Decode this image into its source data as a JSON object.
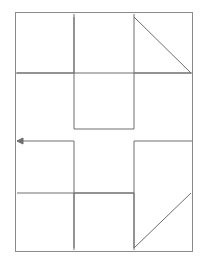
{
  "canvas": {
    "width": 207,
    "height": 268,
    "background_color": "#ffffff"
  },
  "figure": {
    "stroke_color": "#6e6e6e",
    "stroke_width": 1,
    "fill": "none"
  },
  "frame": {
    "name": "outer-border",
    "x": 15.5,
    "y": 12.5,
    "width": 177,
    "height": 239,
    "stroke_color": "#8a8a8a",
    "stroke_width": 1
  },
  "geometry": {
    "left": 16,
    "right": 192,
    "top": 13,
    "bottom": 251,
    "inner_left": 74,
    "inner_right": 134,
    "upper_band": 73,
    "lower_band": 193,
    "mid_upper": 129,
    "mid_lower": 141,
    "center_x": 104,
    "center_y": 132
  },
  "paths": [
    {
      "name": "top-left-triangle",
      "kind": "arrowhead-triangle",
      "points": "74,17 74,73 17,73"
    },
    {
      "name": "top-right-triangle",
      "kind": "arrowhead-triangle",
      "points": "134,17 191,73 134,73"
    },
    {
      "name": "bottom-left-triangle",
      "kind": "arrowhead-triangle",
      "points": "17,193 74,193 74,248"
    },
    {
      "name": "bottom-right-triangle",
      "kind": "arrowhead-triangle",
      "points": "191,193 134,248 134,193"
    },
    {
      "name": "top-center-bracket",
      "kind": "polyline",
      "points": "74,14 74,73 134,73 134,14"
    },
    {
      "name": "bottom-center-bracket",
      "kind": "polyline",
      "points": "74,250 74,193 134,193 134,250"
    },
    {
      "name": "upper-left-stem",
      "kind": "polyline",
      "points": "16,73 74,73 74,129 134,129 134,73 192,73"
    },
    {
      "name": "lower-right-stem",
      "kind": "polyline",
      "points": "192,141 134,141 134,193 74,193 74,141 17,141"
    },
    {
      "name": "upper-right-vertical",
      "kind": "polyline",
      "points": "134,73 134,129"
    },
    {
      "name": "lower-left-vertical",
      "kind": "polyline",
      "points": "74,141 74,193"
    }
  ],
  "arrow": {
    "name": "left-pointing-arrow",
    "tail_x": 74,
    "tip_x": 17,
    "y": 141,
    "head_length": 6,
    "head_half_width": 3,
    "direction": "left",
    "stroke_color": "#6e6e6e"
  },
  "labels": {
    "has_text": false,
    "text_items": []
  }
}
